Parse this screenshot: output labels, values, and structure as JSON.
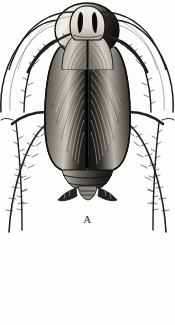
{
  "plate": {
    "title": "Cockroach dorsal view illustration plate",
    "background_color": "#fdfdfc",
    "ink_color": "#1a1a1a",
    "midtone_color": "#6e6a64",
    "highlight_color": "#efece6"
  },
  "figures": [
    {
      "id": "A",
      "label": "A",
      "subject": "cockroach-dorsal-view",
      "view": "dorsal",
      "parts": [
        "antenna-left",
        "antenna-right",
        "pronotum",
        "tegmen-left",
        "tegmen-right",
        "abdomen",
        "cercus-left",
        "cercus-right",
        "leg-foreleg-left",
        "leg-foreleg-right",
        "leg-midleg-left",
        "leg-midleg-right",
        "leg-hindleg-left",
        "leg-hindleg-right"
      ]
    },
    {
      "id": "B",
      "label": "",
      "subject": "cockroach-dorsal-view-cropped",
      "view": "dorsal",
      "pronotum_marking": "two-dark-longitudinal-stripes",
      "parts": [
        "antenna-left",
        "antenna-right",
        "pronotum",
        "tegmen-left",
        "tegmen-right",
        "leg-foreleg-left",
        "leg-foreleg-right"
      ]
    }
  ]
}
